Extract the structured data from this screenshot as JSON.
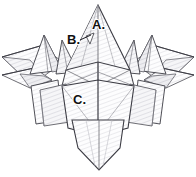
{
  "figure": {
    "name": "origami-model-diagram",
    "background_color": "#ffffff",
    "line_color": "#3c3c44",
    "line_color_soft": "#8b8b93",
    "fill_color": "#fbfbfc",
    "fill_color_shade": "#f0f0f2",
    "fill_color_dark": "#e6e6ea",
    "hatch_color": "#d8d8de",
    "canvas": {
      "width": 196,
      "height": 177
    }
  },
  "labels": [
    {
      "id": "A",
      "text": "A.",
      "x": 92,
      "y": 29,
      "target": "central-peak"
    },
    {
      "id": "B",
      "text": "B.",
      "x": 67,
      "y": 44,
      "target": "inner-left-point"
    },
    {
      "id": "C",
      "text": "C.",
      "x": 73,
      "y": 104,
      "target": "lower-body-panel"
    }
  ],
  "leader_lines": [
    {
      "id": "leader-B",
      "x1": 80,
      "y1": 40,
      "x2": 91,
      "y2": 35
    }
  ]
}
